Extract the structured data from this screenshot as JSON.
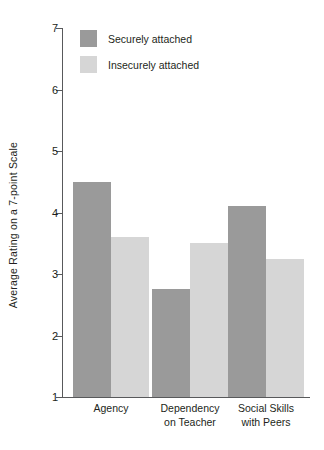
{
  "chart_data": {
    "type": "bar",
    "title": "",
    "xlabel": "",
    "ylabel": "Average Rating on a 7-point Scale",
    "ylim": [
      1,
      7
    ],
    "yticks": [
      1,
      2,
      3,
      4,
      5,
      6,
      7
    ],
    "ytick_labels": [
      "1",
      "2",
      "3",
      "4",
      "5",
      "6",
      "7"
    ],
    "grid": false,
    "legend_position": "top-left-inside",
    "categories": [
      "Agency",
      "Dependency on Teacher",
      "Social Skills with Peers"
    ],
    "category_lines": [
      [
        "Agency"
      ],
      [
        "Dependency",
        "on Teacher"
      ],
      [
        "Social Skills",
        "with Peers"
      ]
    ],
    "series": [
      {
        "name": "Securely attached",
        "color": "#9a9a9a",
        "values": [
          4.5,
          2.75,
          4.1
        ]
      },
      {
        "name": "Insecurely attached",
        "color": "#d6d6d6",
        "values": [
          3.6,
          3.5,
          3.25
        ]
      }
    ]
  },
  "legend": {
    "items": [
      {
        "label": "Securely attached"
      },
      {
        "label": "Insecurely attached"
      }
    ]
  },
  "axis": {
    "y_title": "Average Rating on a 7-point Scale"
  }
}
